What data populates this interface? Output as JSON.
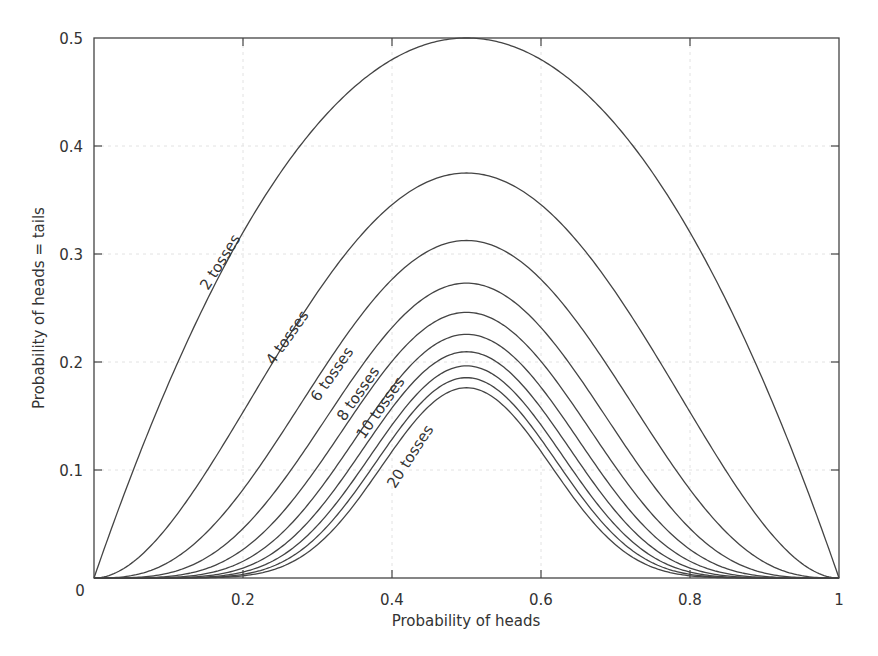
{
  "chart_data": {
    "type": "line",
    "title": "",
    "xlabel": "Probability of heads",
    "ylabel": "Probability of heads = tails",
    "xlim": [
      0,
      1
    ],
    "ylim": [
      0,
      0.5
    ],
    "grid": true,
    "legend": "none (inline curve labels)",
    "x_ticks": [
      "0",
      "0.2",
      "0.4",
      "0.6",
      "0.8",
      "1"
    ],
    "y_ticks": [
      "0",
      "0.1",
      "0.2",
      "0.3",
      "0.4",
      "0.5"
    ],
    "x_tick_values": [
      0,
      0.2,
      0.4,
      0.6,
      0.8,
      1
    ],
    "y_tick_values": [
      0,
      0.1,
      0.2,
      0.3,
      0.4,
      0.5
    ],
    "x": [
      0,
      0.1,
      0.2,
      0.3,
      0.4,
      0.5,
      0.6,
      0.7,
      0.8,
      0.9,
      1
    ],
    "series": [
      {
        "name": "2 tosses",
        "tosses": 2,
        "peak": 0.5,
        "values": [
          0,
          0.18,
          0.32,
          0.42,
          0.48,
          0.5,
          0.48,
          0.42,
          0.32,
          0.18,
          0
        ]
      },
      {
        "name": "4 tosses",
        "tosses": 4,
        "peak": 0.375,
        "values": [
          0,
          0.049,
          0.154,
          0.265,
          0.346,
          0.375,
          0.346,
          0.265,
          0.154,
          0.049,
          0
        ]
      },
      {
        "name": "6 tosses",
        "tosses": 6,
        "peak": 0.3125,
        "values": [
          0,
          0.015,
          0.082,
          0.185,
          0.276,
          0.3125,
          0.276,
          0.185,
          0.082,
          0.015,
          0
        ]
      },
      {
        "name": "8 tosses",
        "tosses": 8,
        "peak": 0.273,
        "values": [
          0,
          0.005,
          0.046,
          0.136,
          0.232,
          0.273,
          0.232,
          0.136,
          0.046,
          0.005,
          0
        ]
      },
      {
        "name": "10 tosses",
        "tosses": 10,
        "peak": 0.246,
        "values": [
          0,
          0.001,
          0.026,
          0.103,
          0.201,
          0.246,
          0.201,
          0.103,
          0.026,
          0.001,
          0
        ]
      },
      {
        "name": "12 tosses",
        "tosses": 12,
        "peak": 0.2256,
        "values": [
          0,
          0.0005,
          0.016,
          0.079,
          0.177,
          0.2256,
          0.177,
          0.079,
          0.016,
          0.0005,
          0
        ]
      },
      {
        "name": "14 tosses",
        "tosses": 14,
        "peak": 0.2095,
        "values": [
          0,
          0.0002,
          0.009,
          0.062,
          0.157,
          0.2095,
          0.157,
          0.062,
          0.009,
          0.0002,
          0
        ]
      },
      {
        "name": "16 tosses",
        "tosses": 16,
        "peak": 0.1964,
        "values": [
          0,
          0.0001,
          0.006,
          0.049,
          0.142,
          0.1964,
          0.142,
          0.049,
          0.006,
          0.0001,
          0
        ]
      },
      {
        "name": "18 tosses",
        "tosses": 18,
        "peak": 0.1855,
        "values": [
          0,
          0,
          0.003,
          0.039,
          0.128,
          0.1855,
          0.128,
          0.039,
          0.003,
          0,
          0
        ]
      },
      {
        "name": "20 tosses",
        "tosses": 20,
        "peak": 0.1762,
        "values": [
          0,
          0,
          0.002,
          0.031,
          0.117,
          0.1762,
          0.117,
          0.031,
          0.002,
          0,
          0
        ]
      }
    ],
    "annotations": [
      {
        "text": "2 tosses",
        "x": 0.175,
        "y": 0.29,
        "angle": -58
      },
      {
        "text": "4 tosses",
        "x": 0.265,
        "y": 0.22,
        "angle": -55
      },
      {
        "text": "6 tosses",
        "x": 0.325,
        "y": 0.186,
        "angle": -55
      },
      {
        "text": "8 tosses",
        "x": 0.36,
        "y": 0.168,
        "angle": -55
      },
      {
        "text": "10 tosses",
        "x": 0.39,
        "y": 0.155,
        "angle": -55
      },
      {
        "text": "20 tosses",
        "x": 0.43,
        "y": 0.11,
        "angle": -57
      }
    ]
  }
}
